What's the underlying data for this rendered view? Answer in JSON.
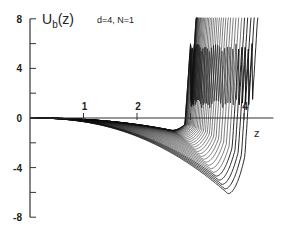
{
  "chart_data": {
    "type": "line",
    "title": "",
    "ylabel": "U_b(z)",
    "ylabel_main": "U",
    "ylabel_sub": "b",
    "ylabel_arg": "(z)",
    "xlabel": "z",
    "annotation": "d=4, N=1",
    "xlim": [
      0,
      4.5
    ],
    "ylim": [
      -8,
      8
    ],
    "x_ticks": [
      1,
      2,
      3,
      4
    ],
    "x_tick_labels": [
      "1",
      "2",
      "",
      "4"
    ],
    "y_ticks": [
      8,
      6,
      4,
      2,
      0,
      -2,
      -4,
      -6,
      -8
    ],
    "y_tick_labels": [
      "8",
      "",
      "4",
      "",
      "0",
      "",
      "-4",
      "",
      "-8"
    ],
    "grid": false,
    "legend": null,
    "series_family": {
      "count": 40,
      "wall_position_range": [
        3.0,
        4.15
      ],
      "min_depth_range": [
        -1.0,
        -6.1
      ],
      "deepest_curve": {
        "x": [
          0,
          1,
          2,
          2.5,
          3,
          3.4,
          3.75,
          3.95,
          4.05,
          4.12,
          4.2
        ],
        "y": [
          0,
          -0.35,
          -1.8,
          -3.0,
          -4.3,
          -5.4,
          -6.1,
          -5.2,
          -2.0,
          1.5,
          8
        ]
      },
      "shallowest_curve": {
        "x": [
          0,
          1,
          2,
          2.5,
          2.8,
          3.0,
          3.1
        ],
        "y": [
          0,
          -0.3,
          -0.9,
          -0.8,
          0.5,
          4,
          8
        ]
      }
    }
  },
  "axes": {
    "y_axis_x": 30,
    "x_axis_y": 118,
    "px_per_x": 53.5,
    "px_per_y": 12.4
  }
}
